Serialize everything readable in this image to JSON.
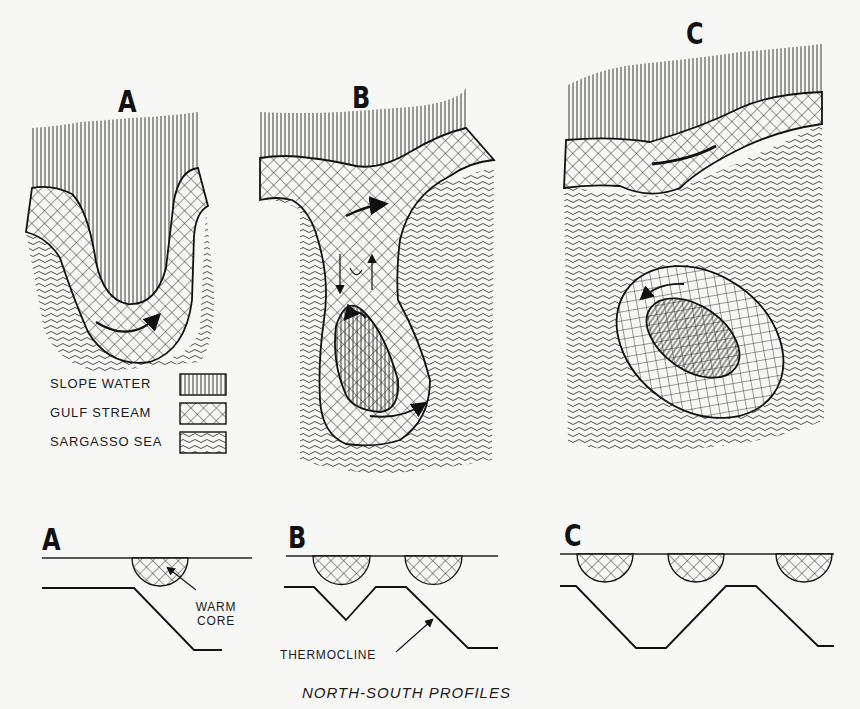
{
  "plan_views": {
    "panels": [
      {
        "id": "A",
        "label": "A"
      },
      {
        "id": "B",
        "label": "B"
      },
      {
        "id": "C",
        "label": "C"
      }
    ]
  },
  "legend": {
    "items": [
      {
        "label": "SLOPE WATER",
        "pattern": "vertical-lines"
      },
      {
        "label": "GULF STREAM",
        "pattern": "crosshatch"
      },
      {
        "label": "SARGASSO SEA",
        "pattern": "wavy-lines"
      }
    ]
  },
  "profiles": {
    "panels": [
      {
        "id": "A",
        "label": "A",
        "warm_cores": 1
      },
      {
        "id": "B",
        "label": "B",
        "warm_cores": 2
      },
      {
        "id": "C",
        "label": "C",
        "warm_cores": 3
      }
    ],
    "annotations": {
      "warm_core": [
        "WARM",
        "CORE"
      ],
      "thermocline": "THERMOCLINE"
    },
    "caption": "NORTH-SOUTH PROFILES"
  },
  "colors": {
    "ink": "#161616",
    "paper": "#f7f7f5"
  }
}
